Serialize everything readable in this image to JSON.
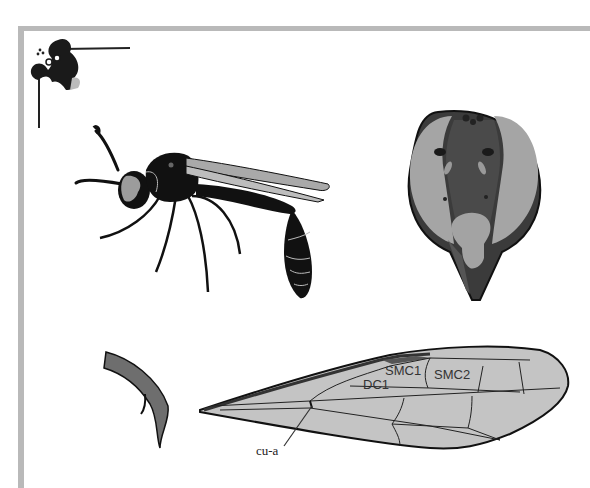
{
  "figure": {
    "type": "entomology illustration plate",
    "panels": [
      {
        "id": "habitus",
        "description": "wasp lateral view"
      },
      {
        "id": "head",
        "description": "head frontal view"
      },
      {
        "id": "claw",
        "description": "tarsal claw"
      },
      {
        "id": "forewing",
        "description": "forewing venation"
      }
    ]
  },
  "forewing": {
    "labels": {
      "smc1": "SMC1",
      "smc2": "SMC2",
      "dc1": "DC1",
      "cu_a": "cu-a"
    }
  },
  "colors": {
    "frame": "#b9b9b9",
    "ink": "#111111",
    "wing_fill": "#c4c4c4",
    "head_dark": "#4a4a4a",
    "eye_gray": "#a8a8a8"
  }
}
